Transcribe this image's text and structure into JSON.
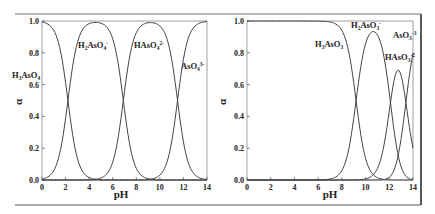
{
  "chart_data": [
    {
      "type": "line",
      "title": "",
      "xlabel": "pH",
      "ylabel": "α",
      "xlim": [
        0,
        14
      ],
      "ylim": [
        0.0,
        1.0
      ],
      "xticks": [
        "0",
        "2",
        "4",
        "6",
        "8",
        "10",
        "12",
        "14"
      ],
      "yticks": [
        "0.0",
        "0.2",
        "0.4",
        "0.6",
        "0.8",
        "1.0"
      ],
      "grid": false,
      "legend": "inline labels",
      "pKa": [
        2.2,
        6.9,
        11.5
      ],
      "series": [
        {
          "name": "H3AsO4",
          "label_main": "H",
          "label_parts": [
            "H",
            "3",
            "AsO",
            "4",
            ""
          ],
          "x": [
            0,
            1,
            2,
            2.2,
            3,
            4,
            5,
            6,
            14
          ],
          "values": [
            0.99,
            0.94,
            0.61,
            0.5,
            0.14,
            0.02,
            0.0,
            0.0,
            0.0
          ]
        },
        {
          "name": "H2AsO4-",
          "label_parts": [
            "H",
            "2",
            "AsO",
            "4",
            "-"
          ],
          "x": [
            0,
            1,
            2.2,
            3,
            4.5,
            6,
            6.9,
            8,
            10,
            14
          ],
          "values": [
            0.01,
            0.06,
            0.5,
            0.86,
            0.99,
            0.89,
            0.5,
            0.07,
            0.0,
            0.0
          ]
        },
        {
          "name": "HAsO4 2-",
          "label_parts": [
            "H",
            "",
            "AsO",
            "4",
            "2-"
          ],
          "x": [
            0,
            5,
            6,
            6.9,
            8,
            9.2,
            10.5,
            11.5,
            12.5,
            14
          ],
          "values": [
            0.0,
            0.01,
            0.11,
            0.5,
            0.93,
            0.99,
            0.91,
            0.5,
            0.09,
            0.0
          ]
        },
        {
          "name": "AsO4 3-",
          "label_parts": [
            "",
            "",
            "AsO",
            "4",
            "3-"
          ],
          "x": [
            0,
            10,
            11,
            11.5,
            12,
            13,
            14
          ],
          "values": [
            0.0,
            0.03,
            0.24,
            0.5,
            0.76,
            0.97,
            1.0
          ]
        }
      ]
    },
    {
      "type": "line",
      "title": "",
      "xlabel": "pH",
      "ylabel": "α",
      "xlim": [
        0,
        14
      ],
      "ylim": [
        0.0,
        1.0
      ],
      "xticks": [
        "0",
        "2",
        "4",
        "6",
        "8",
        "10",
        "12",
        "14"
      ],
      "yticks": [
        "0.0",
        "0.2",
        "0.4",
        "0.6",
        "0.8",
        "1.0"
      ],
      "grid": false,
      "legend": "inline labels",
      "pKa": [
        9.2,
        12.1,
        13.4
      ],
      "series": [
        {
          "name": "H3AsO3",
          "x": [
            0,
            6,
            7,
            8,
            9.2,
            10,
            11,
            12,
            14
          ],
          "values": [
            1.0,
            1.0,
            0.99,
            0.94,
            0.5,
            0.14,
            0.02,
            0.0,
            0.0
          ]
        },
        {
          "name": "H2AsO3-",
          "x": [
            0,
            6,
            7,
            8,
            9.2,
            10,
            10.6,
            11.5,
            12.1,
            13,
            14
          ],
          "values": [
            0.0,
            0.0,
            0.01,
            0.06,
            0.5,
            0.83,
            0.93,
            0.78,
            0.48,
            0.1,
            0.0
          ]
        },
        {
          "name": "HAsO3 2-",
          "x": [
            0,
            10,
            11,
            12.1,
            12.7,
            13.4,
            14
          ],
          "values": [
            0.0,
            0.01,
            0.08,
            0.5,
            0.66,
            0.48,
            0.17
          ]
        },
        {
          "name": "AsO3 3-",
          "x": [
            0,
            11,
            12,
            12.5,
            13,
            13.4,
            14
          ],
          "values": [
            0.0,
            0.0,
            0.02,
            0.08,
            0.25,
            0.5,
            0.82
          ]
        }
      ]
    }
  ],
  "labels": {
    "left": {
      "h3aso4": {
        "a": "H",
        "b": "3",
        "c": "AsO",
        "d": "4",
        "e": ""
      },
      "h2aso4": {
        "a": "H",
        "b": "2",
        "c": "AsO",
        "d": "4",
        "e": "-"
      },
      "haso4": {
        "a": "HAsO",
        "d": "4",
        "e": "2-"
      },
      "aso4": {
        "a": "AsO",
        "d": "4",
        "e": "3-"
      }
    },
    "right": {
      "h3aso3": {
        "a": "H",
        "b": "3",
        "c": "AsO",
        "d": "3"
      },
      "h2aso3": {
        "a": "H",
        "b": "2",
        "c": "AsO",
        "d": "3",
        "e": "-"
      },
      "haso3": {
        "a": "HAsO",
        "d": "3",
        "e": "-2"
      },
      "aso3": {
        "a": "AsO",
        "d": "3",
        "e": "-3"
      }
    },
    "xlabel": "pH",
    "ylabel": "α"
  }
}
